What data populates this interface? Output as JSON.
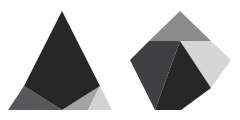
{
  "canvas": {
    "width": 240,
    "height": 120,
    "background": "#ffffff",
    "description": "Two flat-shaded grey polyhedral figures on a white background"
  },
  "palette": {
    "near_black": "#272727",
    "dark_charcoal": "#2d2d2d",
    "dark_gray": "#3f3f41",
    "mid_dark_gray": "#58585a",
    "mid_gray": "#8a8a8a",
    "light_mid_gray": "#a3a3a3",
    "light_gray": "#d2d2d2",
    "pale_gray": "#d6d6d6",
    "background": "#ffffff"
  },
  "figures": [
    {
      "name": "triangle-figure",
      "label": "Left triangular figure",
      "outline": "62,11 112,110 8,110",
      "facets": [
        {
          "name": "triangle-facet-upper-dark",
          "label": "Upper dark facet",
          "points": "62,11 100,86 62,110 24,86",
          "color": "#272727"
        },
        {
          "name": "triangle-facet-left-mid",
          "label": "Left mid-tone facet",
          "points": "24,86 62,110 34,110 8,110",
          "color": "#58585a"
        },
        {
          "name": "triangle-facet-left-upper",
          "label": "Left upper facet wedge",
          "points": "24,86 8,110 8,110 24,86",
          "color": "#58585a"
        },
        {
          "name": "triangle-facet-bottom-mid",
          "label": "Bottom centre facet",
          "points": "62,110 100,86 88,110",
          "color": "#a3a3a3"
        },
        {
          "name": "triangle-facet-right-light",
          "label": "Right light facet",
          "points": "100,86 112,110 88,110",
          "color": "#d2d2d2"
        }
      ]
    },
    {
      "name": "diamond-figure",
      "label": "Right diamond figure",
      "outline": "180,11 231,60 181,110 130,60",
      "facets": [
        {
          "name": "diamond-facet-top-mid",
          "label": "Top mid-tone facet",
          "points": "180,11 211,41 149,41",
          "color": "#8a8a8a"
        },
        {
          "name": "diamond-facet-left-dark",
          "label": "Left dark facet",
          "points": "149,41 180,41 155,110 130,60",
          "color": "#3f3f41"
        },
        {
          "name": "diamond-facet-center-black",
          "label": "Centre near-black facet",
          "points": "180,41 211,88 181,110 155,110",
          "color": "#272727"
        },
        {
          "name": "diamond-facet-right-light",
          "label": "Right light facet",
          "points": "211,41 231,60 211,88 180,41",
          "color": "#d6d6d6"
        }
      ]
    }
  ]
}
